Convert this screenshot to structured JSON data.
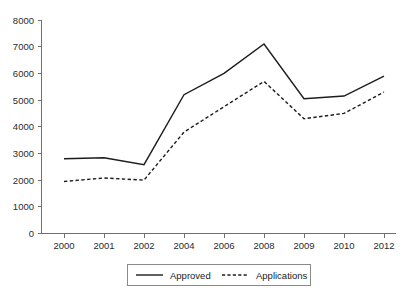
{
  "chart_data": {
    "type": "line",
    "title": "",
    "subtitle": "",
    "xlabel": "",
    "ylabel": "",
    "categories": [
      "2000",
      "2001",
      "2002",
      "2004",
      "2006",
      "2008",
      "2009",
      "2010",
      "2012"
    ],
    "ylim": [
      0,
      8000
    ],
    "ytick_labels": [
      "0",
      "1000",
      "2000",
      "3000",
      "4000",
      "5000",
      "6000",
      "7000",
      "8000"
    ],
    "ytick_values": [
      0,
      1000,
      2000,
      3000,
      4000,
      5000,
      6000,
      7000,
      8000
    ],
    "grid": false,
    "legend_position": "bottom-center",
    "series": [
      {
        "name": "Approved",
        "style": "solid",
        "color": "#1c1c1c",
        "values": [
          2800,
          2840,
          2580,
          5200,
          6000,
          7100,
          5050,
          5150,
          5900
        ]
      },
      {
        "name": "Applications",
        "style": "dashed",
        "color": "#1c1c1c",
        "values": [
          1950,
          2080,
          2000,
          3800,
          4750,
          5700,
          4300,
          4500,
          5300
        ]
      }
    ]
  },
  "legend": {
    "items": [
      {
        "label": "Approved",
        "style": "solid"
      },
      {
        "label": "Applications",
        "style": "dashed"
      }
    ]
  },
  "axes": {
    "y_axis_name": "value-axis",
    "x_axis_name": "year-axis"
  },
  "colors": {
    "line": "#1c1c1c",
    "axis": "#6f6f6f",
    "text": "#2b2b2b",
    "background": "#ffffff",
    "legend_border": "#8a8a8a"
  }
}
